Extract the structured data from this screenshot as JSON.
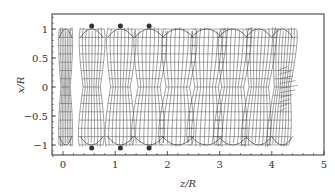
{
  "chart_data": {
    "type": "wireframe-surface",
    "title": "",
    "xlabel": "z/R",
    "ylabel": "x/R",
    "xlim": [
      -0.2,
      5
    ],
    "ylim": [
      -1.25,
      1.25
    ],
    "x_ticks": [
      "0",
      "1",
      "2",
      "3",
      "4",
      "5"
    ],
    "y_ticks": [
      "1",
      "0.5",
      "0",
      "−0.5",
      "−1"
    ],
    "grid": false,
    "legend": null,
    "rings": [
      {
        "z_center": 0.05,
        "half_width": 0.12
      },
      {
        "z_center": 0.55,
        "half_width": 0.22
      },
      {
        "z_center": 1.1,
        "half_width": 0.25
      },
      {
        "z_center": 1.65,
        "half_width": 0.28
      },
      {
        "z_center": 2.2,
        "half_width": 0.3
      },
      {
        "z_center": 2.75,
        "half_width": 0.3
      },
      {
        "z_center": 3.25,
        "half_width": 0.28
      },
      {
        "z_center": 3.75,
        "half_width": 0.25
      },
      {
        "z_center": 4.2,
        "half_width": 0.2
      }
    ],
    "markers": [
      {
        "z": 0.55,
        "x": 1.05
      },
      {
        "z": 1.1,
        "x": 1.05
      },
      {
        "z": 1.65,
        "x": 1.05
      },
      {
        "z": 0.55,
        "x": -1.05
      },
      {
        "z": 1.1,
        "x": -1.05
      },
      {
        "z": 1.65,
        "x": -1.05
      }
    ],
    "colors": {
      "line": "#444444",
      "marker": "#333333",
      "frame": "#333333"
    }
  }
}
